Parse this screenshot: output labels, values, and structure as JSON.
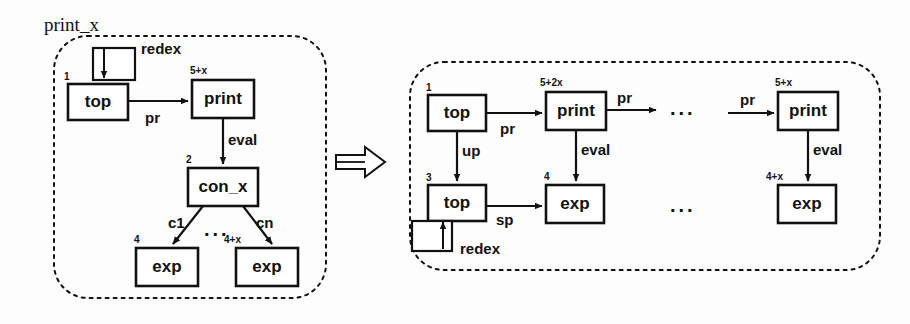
{
  "figure": {
    "rewrite_symbol": "=>"
  },
  "lhs": {
    "region_label": "print_x",
    "self_loop_label": "redex",
    "nodes": [
      {
        "id": "top1",
        "label": "top",
        "port": "1",
        "x": 68,
        "y": 84,
        "w": 60,
        "h": 36
      },
      {
        "id": "print1",
        "label": "print",
        "port": "5+x",
        "x": 192,
        "y": 80,
        "w": 62,
        "h": 38
      },
      {
        "id": "conx",
        "label": "con_x",
        "port": "2",
        "x": 188,
        "y": 168,
        "w": 70,
        "h": 38
      },
      {
        "id": "exp1",
        "label": "exp",
        "port": "4",
        "x": 136,
        "y": 248,
        "w": 62,
        "h": 38
      },
      {
        "id": "exp2",
        "label": "exp",
        "port": "4+x",
        "x": 236,
        "y": 248,
        "w": 62,
        "h": 38
      }
    ],
    "edges": [
      {
        "from": "top1",
        "to": "print1",
        "label": "pr"
      },
      {
        "from": "print1",
        "to": "conx",
        "label": "eval"
      },
      {
        "from": "conx",
        "to": "exp1",
        "label": "c1"
      },
      {
        "from": "conx",
        "to": "exp2",
        "label": "cn"
      }
    ],
    "ellipsis": "..."
  },
  "rhs": {
    "self_loop_label": "redex",
    "nodes": [
      {
        "id": "top1",
        "label": "top",
        "port": "1",
        "x": 428,
        "y": 95,
        "w": 58,
        "h": 36
      },
      {
        "id": "print1",
        "label": "print",
        "port": "5+2x",
        "x": 546,
        "y": 92,
        "w": 60,
        "h": 38
      },
      {
        "id": "top3",
        "label": "top",
        "port": "3",
        "x": 428,
        "y": 185,
        "w": 58,
        "h": 36
      },
      {
        "id": "exp4",
        "label": "exp",
        "port": "4",
        "x": 546,
        "y": 185,
        "w": 58,
        "h": 38
      },
      {
        "id": "print2",
        "label": "print",
        "port": "5+x",
        "x": 778,
        "y": 92,
        "w": 60,
        "h": 38
      },
      {
        "id": "exp5",
        "label": "exp",
        "port": "4+x",
        "x": 778,
        "y": 185,
        "w": 58,
        "h": 38
      }
    ],
    "edges": [
      {
        "from": "top1",
        "to": "print1",
        "label": "pr"
      },
      {
        "from": "top1",
        "to": "top3",
        "label": "up"
      },
      {
        "from": "print1",
        "to": "exp4",
        "label": "eval"
      },
      {
        "from": "top3",
        "to": "exp4",
        "label": "sp"
      },
      {
        "from": "print1",
        "to": "dots",
        "label": "pr"
      },
      {
        "from": "dots",
        "to": "print2",
        "label": "pr"
      },
      {
        "from": "print2",
        "to": "exp5",
        "label": "eval"
      }
    ],
    "ellipsis_top": "...",
    "ellipsis_bottom": "..."
  },
  "colors": {
    "stroke": "#111111",
    "fill": "#ffffff",
    "background": "#fdfdfd"
  }
}
